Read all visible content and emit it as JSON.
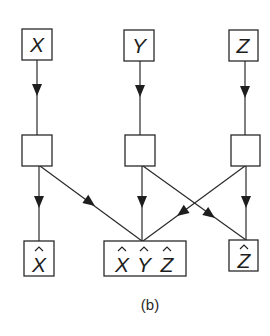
{
  "diagram": {
    "caption": "(b)",
    "colors": {
      "stroke": "#2a2a2a",
      "text": "#1e1e1e",
      "background": "#ffffff"
    },
    "inputs": [
      {
        "id": "X",
        "label": "X"
      },
      {
        "id": "Y",
        "label": "Y"
      },
      {
        "id": "Z",
        "label": "Z"
      }
    ],
    "processors": [
      {
        "id": "px",
        "label": ""
      },
      {
        "id": "py",
        "label": ""
      },
      {
        "id": "pz",
        "label": ""
      }
    ],
    "outputs": [
      {
        "id": "Xhat",
        "label": "X",
        "hat": true
      },
      {
        "id": "XYZhat",
        "labels": [
          "X",
          "Y",
          "Z"
        ],
        "hat": true
      },
      {
        "id": "Zhat",
        "label": "Z",
        "hat": true
      }
    ],
    "edges": [
      {
        "from": "X",
        "to": "px"
      },
      {
        "from": "Y",
        "to": "py"
      },
      {
        "from": "Z",
        "to": "pz"
      },
      {
        "from": "px",
        "to": "Xhat"
      },
      {
        "from": "px",
        "to": "XYZhat"
      },
      {
        "from": "py",
        "to": "XYZhat"
      },
      {
        "from": "py",
        "to": "Zhat"
      },
      {
        "from": "pz",
        "to": "XYZhat"
      },
      {
        "from": "pz",
        "to": "Zhat"
      }
    ]
  }
}
